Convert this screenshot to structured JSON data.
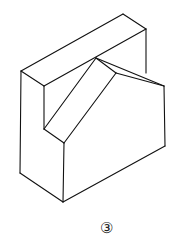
{
  "figure": {
    "type": "isometric-block-drawing",
    "stroke_color": "#111111",
    "background": "#ffffff",
    "edges": [
      {
        "name": "back-slab-top-left-edge",
        "x1": 21,
        "y1": 71,
        "x2": 123,
        "y2": 14
      },
      {
        "name": "back-slab-top-back-edge",
        "x1": 123,
        "y1": 14,
        "x2": 146,
        "y2": 29
      },
      {
        "name": "back-slab-top-front-edge",
        "x1": 44,
        "y1": 86,
        "x2": 146,
        "y2": 29
      },
      {
        "name": "back-slab-top-side-edge",
        "x1": 21,
        "y1": 71,
        "x2": 44,
        "y2": 86
      },
      {
        "name": "back-slab-right-vertical",
        "x1": 146,
        "y1": 29,
        "x2": 146,
        "y2": 73
      },
      {
        "name": "left-outer-vertical",
        "x1": 21,
        "y1": 71,
        "x2": 20,
        "y2": 173
      },
      {
        "name": "inner-left-vertical",
        "x1": 44,
        "y1": 86,
        "x2": 44,
        "y2": 129
      },
      {
        "name": "slant-face-back-edge",
        "x1": 96,
        "y1": 58,
        "x2": 44,
        "y2": 129
      },
      {
        "name": "slant-face-front-edge",
        "x1": 116,
        "y1": 73,
        "x2": 64,
        "y2": 143
      },
      {
        "name": "slant-face-bottom-edge",
        "x1": 44,
        "y1": 129,
        "x2": 64,
        "y2": 143
      },
      {
        "name": "slant-face-top-edge",
        "x1": 96,
        "y1": 58,
        "x2": 116,
        "y2": 73
      },
      {
        "name": "chamfer-back-edge",
        "x1": 96,
        "y1": 58,
        "x2": 164,
        "y2": 86
      },
      {
        "name": "chamfer-front-edge",
        "x1": 116,
        "y1": 73,
        "x2": 164,
        "y2": 86
      },
      {
        "name": "right-vertical",
        "x1": 164,
        "y1": 86,
        "x2": 165,
        "y2": 146
      },
      {
        "name": "front-vertical",
        "x1": 64,
        "y1": 143,
        "x2": 63,
        "y2": 202
      },
      {
        "name": "bottom-right-edge",
        "x1": 63,
        "y1": 202,
        "x2": 165,
        "y2": 146
      },
      {
        "name": "bottom-left-edge",
        "x1": 20,
        "y1": 173,
        "x2": 63,
        "y2": 202
      }
    ]
  },
  "caption": {
    "label": "③"
  }
}
